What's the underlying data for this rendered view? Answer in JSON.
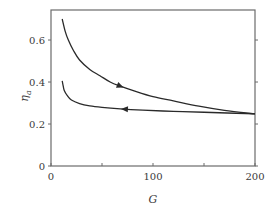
{
  "chart_data": {
    "type": "line",
    "title": "",
    "xlabel": "G",
    "ylabel": "η_a",
    "ylabel_main": "η",
    "ylabel_sub": "a",
    "xlim": [
      0,
      200
    ],
    "ylim": [
      0,
      0.743
    ],
    "x_ticks": [
      0,
      50,
      100,
      150,
      200
    ],
    "x_tick_labels": [
      "0",
      "100",
      "200"
    ],
    "x_tick_label_values": [
      0,
      100,
      200
    ],
    "y_ticks": [
      0,
      0.2,
      0.4,
      0.6
    ],
    "y_tick_labels": [
      "0",
      "0.2",
      "0.4",
      "0.6"
    ],
    "grid": false,
    "legend": null,
    "series": [
      {
        "name": "upper branch (increasing G)",
        "direction": "forward",
        "arrow_at_x": 68,
        "x": [
          11,
          14,
          17,
          22,
          28,
          38,
          48,
          58,
          68,
          80,
          100,
          120,
          145,
          170,
          200
        ],
        "y": [
          0.7,
          0.64,
          0.6,
          0.55,
          0.505,
          0.46,
          0.43,
          0.4,
          0.38,
          0.36,
          0.33,
          0.31,
          0.285,
          0.265,
          0.248
        ]
      },
      {
        "name": "lower branch (decreasing G)",
        "direction": "backward",
        "arrow_at_x": 72,
        "x": [
          11,
          12,
          13,
          16,
          20,
          28,
          38,
          50,
          68,
          90,
          120,
          150,
          200
        ],
        "y": [
          0.405,
          0.38,
          0.36,
          0.335,
          0.314,
          0.297,
          0.286,
          0.279,
          0.272,
          0.266,
          0.26,
          0.256,
          0.248
        ]
      }
    ]
  },
  "colors": {
    "axis": "#6b6b6b",
    "curve": "#2a2a2a",
    "text": "#3a3a3a"
  }
}
